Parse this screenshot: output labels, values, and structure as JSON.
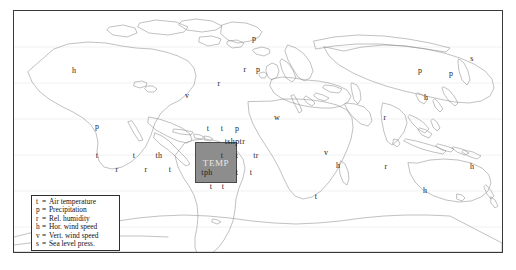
{
  "figure": {
    "background_color": "#ffffff",
    "frame_color": "#3a3a3a",
    "coastline_color": "#8e8e8e"
  },
  "domain_box": {
    "label": "TEMP",
    "fill_color": "#8d8d8d",
    "border_color": "#4a4a4a",
    "text_color": "#e8e8e8"
  },
  "legend": {
    "border_color": "#2e2e2e",
    "entries": [
      {
        "symbol": "t",
        "eq": "=",
        "text": "Air temperature"
      },
      {
        "symbol": "p",
        "eq": "=",
        "text": "Precipitation"
      },
      {
        "symbol": "r",
        "eq": "=",
        "text": "Rel. humidity"
      },
      {
        "symbol": "h",
        "eq": "=",
        "text": "Hor. wind speed"
      },
      {
        "symbol": "v",
        "eq": "=",
        "text": "Vert. wind speed"
      },
      {
        "symbol": "s",
        "eq": "=",
        "text": "Sea level press."
      }
    ]
  },
  "markers": [
    {
      "text": "h",
      "x": 73,
      "y": 70
    },
    {
      "text": "p",
      "x": 96,
      "y": 126
    },
    {
      "text": "t",
      "x": 96,
      "y": 155
    },
    {
      "text": "t",
      "x": 133,
      "y": 155
    },
    {
      "text": "r",
      "x": 116,
      "y": 169
    },
    {
      "text": "r",
      "x": 145,
      "y": 169
    },
    {
      "text": "th",
      "x": 158,
      "y": 155
    },
    {
      "text": "t",
      "x": 169,
      "y": 169
    },
    {
      "text": "v",
      "x": 186,
      "y": 95
    },
    {
      "text": "t",
      "x": 207,
      "y": 128
    },
    {
      "text": "t",
      "x": 221,
      "y": 128
    },
    {
      "text": "p",
      "x": 236,
      "y": 128
    },
    {
      "text": "tshptr",
      "x": 234,
      "y": 141
    },
    {
      "text": "t",
      "x": 221,
      "y": 155
    },
    {
      "text": "t",
      "x": 236,
      "y": 155
    },
    {
      "text": "tr",
      "x": 255,
      "y": 155
    },
    {
      "text": "tph",
      "x": 206,
      "y": 172
    },
    {
      "text": "t",
      "x": 236,
      "y": 172
    },
    {
      "text": "t",
      "x": 250,
      "y": 172
    },
    {
      "text": "t",
      "x": 210,
      "y": 186
    },
    {
      "text": "t",
      "x": 222,
      "y": 186
    },
    {
      "text": "p",
      "x": 253,
      "y": 38
    },
    {
      "text": "r",
      "x": 218,
      "y": 83
    },
    {
      "text": "r",
      "x": 244,
      "y": 69
    },
    {
      "text": "p",
      "x": 257,
      "y": 69
    },
    {
      "text": "w",
      "x": 276,
      "y": 117
    },
    {
      "text": "v",
      "x": 325,
      "y": 152
    },
    {
      "text": "h",
      "x": 337,
      "y": 165
    },
    {
      "text": "r",
      "x": 385,
      "y": 166
    },
    {
      "text": "r",
      "x": 384,
      "y": 117
    },
    {
      "text": "t",
      "x": 315,
      "y": 196
    },
    {
      "text": "p",
      "x": 419,
      "y": 70
    },
    {
      "text": "s",
      "x": 471,
      "y": 58
    },
    {
      "text": "p",
      "x": 450,
      "y": 73
    },
    {
      "text": "h",
      "x": 425,
      "y": 97
    },
    {
      "text": "h",
      "x": 471,
      "y": 166
    },
    {
      "text": "h",
      "x": 424,
      "y": 190
    }
  ]
}
